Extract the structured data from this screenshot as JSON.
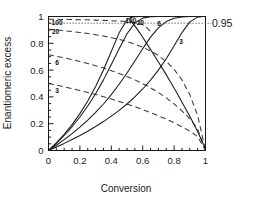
{
  "chart_data": {
    "type": "line",
    "title": "",
    "xlabel": "Conversion",
    "ylabel": "Enantiomeric excess",
    "xlim": [
      0,
      1
    ],
    "ylim": [
      0,
      1
    ],
    "xticks": [
      "0",
      "0.2",
      "0.4",
      "0.6",
      "0.8",
      "1"
    ],
    "xtick_values": [
      0,
      0.2,
      0.4,
      0.6,
      0.8,
      1
    ],
    "yticks": [
      "0",
      "0.2",
      "0.4",
      "0.6",
      "0.8",
      "1"
    ],
    "ytick_values": [
      0,
      0.2,
      0.4,
      0.6,
      0.8,
      1
    ],
    "grid": false,
    "legend": "inline-curve-labels",
    "annotations": [
      {
        "name": "reference-line-label",
        "text": "0.95",
        "value": 0.95,
        "position": "right-outside"
      }
    ],
    "reference_lines": [
      {
        "name": "ee-095-dotted-line",
        "y": 0.95,
        "style": "dotted",
        "label": "0.95"
      }
    ],
    "series": [
      {
        "name": "ee-product-E3",
        "label": "3",
        "style": "dashed",
        "selectivity_E": 3,
        "label_x": 0.055,
        "label_y": 0.445,
        "x": [
          0.0,
          0.05,
          0.1,
          0.15,
          0.2,
          0.25,
          0.3,
          0.35,
          0.4,
          0.45,
          0.5,
          0.55,
          0.6,
          0.65,
          0.7,
          0.75,
          0.8,
          0.85,
          0.9,
          0.95,
          1.0
        ],
        "y": [
          0.5,
          0.488,
          0.475,
          0.462,
          0.448,
          0.433,
          0.418,
          0.401,
          0.384,
          0.366,
          0.347,
          0.327,
          0.306,
          0.283,
          0.259,
          0.234,
          0.207,
          0.177,
          0.145,
          0.104,
          0.0
        ]
      },
      {
        "name": "ee-product-E6",
        "label": "6",
        "style": "dashed",
        "selectivity_E": 6,
        "label_x": 0.055,
        "label_y": 0.655,
        "x": [
          0.0,
          0.05,
          0.1,
          0.15,
          0.2,
          0.25,
          0.3,
          0.35,
          0.4,
          0.45,
          0.5,
          0.55,
          0.6,
          0.65,
          0.7,
          0.75,
          0.8,
          0.85,
          0.9,
          0.95,
          1.0
        ],
        "y": [
          0.714,
          0.703,
          0.691,
          0.678,
          0.664,
          0.649,
          0.633,
          0.615,
          0.596,
          0.575,
          0.552,
          0.527,
          0.499,
          0.468,
          0.433,
          0.393,
          0.348,
          0.296,
          0.238,
          0.16,
          0.0
        ]
      },
      {
        "name": "ee-product-E20",
        "label": "20",
        "style": "dashed",
        "selectivity_E": 20,
        "label_x": 0.045,
        "label_y": 0.885,
        "x": [
          0.0,
          0.05,
          0.1,
          0.15,
          0.2,
          0.25,
          0.3,
          0.35,
          0.4,
          0.45,
          0.5,
          0.55,
          0.6,
          0.65,
          0.7,
          0.75,
          0.8,
          0.85,
          0.9,
          0.95,
          1.0
        ],
        "y": [
          0.905,
          0.9,
          0.894,
          0.888,
          0.881,
          0.873,
          0.864,
          0.854,
          0.842,
          0.829,
          0.813,
          0.794,
          0.771,
          0.743,
          0.708,
          0.664,
          0.606,
          0.527,
          0.416,
          0.262,
          0.0
        ]
      },
      {
        "name": "ee-product-E100",
        "label": "100",
        "style": "dashed",
        "selectivity_E": 100,
        "label_x": 0.055,
        "label_y": 0.955,
        "x": [
          0.0,
          0.05,
          0.1,
          0.15,
          0.2,
          0.25,
          0.3,
          0.35,
          0.4,
          0.45,
          0.48,
          0.5,
          0.52,
          0.55,
          0.58,
          0.6,
          0.62,
          0.65
        ],
        "y": [
          0.98,
          0.979,
          0.978,
          0.977,
          0.976,
          0.975,
          0.973,
          0.971,
          0.969,
          0.966,
          0.964,
          0.962,
          0.959,
          0.954,
          0.946,
          0.938,
          0.925,
          0.888
        ]
      },
      {
        "name": "ee-substrate-E3",
        "label": "3",
        "style": "solid",
        "selectivity_E": 3,
        "label_x": 0.845,
        "label_y": 0.815,
        "x": [
          0.0,
          0.05,
          0.1,
          0.15,
          0.2,
          0.25,
          0.3,
          0.35,
          0.4,
          0.45,
          0.5,
          0.55,
          0.6,
          0.65,
          0.7,
          0.75,
          0.8,
          0.85,
          0.9,
          0.95,
          0.98,
          1.0
        ],
        "y": [
          0.0,
          0.026,
          0.053,
          0.082,
          0.112,
          0.144,
          0.179,
          0.216,
          0.257,
          0.3,
          0.347,
          0.4,
          0.459,
          0.525,
          0.6,
          0.685,
          0.781,
          0.88,
          0.96,
          0.995,
          1.0,
          1.0
        ]
      },
      {
        "name": "ee-substrate-E6",
        "label": "6",
        "style": "solid",
        "selectivity_E": 6,
        "label_x": 0.705,
        "label_y": 0.945,
        "x": [
          0.0,
          0.05,
          0.1,
          0.15,
          0.2,
          0.25,
          0.3,
          0.35,
          0.4,
          0.45,
          0.5,
          0.55,
          0.6,
          0.65,
          0.7,
          0.75,
          0.8,
          0.85,
          0.9,
          1.0
        ],
        "y": [
          0.0,
          0.039,
          0.081,
          0.126,
          0.174,
          0.227,
          0.284,
          0.347,
          0.417,
          0.494,
          0.578,
          0.668,
          0.76,
          0.846,
          0.915,
          0.962,
          0.987,
          0.997,
          1.0,
          1.0
        ]
      },
      {
        "name": "ee-substrate-E20",
        "label": "20",
        "style": "solid",
        "selectivity_E": 20,
        "label_x": 0.585,
        "label_y": 0.955,
        "x": [
          0.0,
          0.05,
          0.1,
          0.15,
          0.2,
          0.25,
          0.3,
          0.35,
          0.4,
          0.45,
          0.5,
          0.55,
          0.6,
          0.65,
          0.7,
          0.8,
          0.9,
          1.0
        ],
        "y": [
          0.0,
          0.053,
          0.112,
          0.177,
          0.25,
          0.332,
          0.424,
          0.527,
          0.641,
          0.76,
          0.871,
          0.951,
          0.988,
          0.998,
          1.0,
          1.0,
          1.0,
          1.0
        ]
      },
      {
        "name": "ee-substrate-E100",
        "label": "100",
        "style": "solid",
        "selectivity_E": 100,
        "label_x": 0.525,
        "label_y": 0.965,
        "x": [
          0.0,
          0.05,
          0.1,
          0.15,
          0.2,
          0.25,
          0.3,
          0.35,
          0.4,
          0.45,
          0.5,
          0.52,
          0.55,
          0.6,
          0.7,
          0.85,
          1.0
        ],
        "y": [
          0.0,
          0.057,
          0.121,
          0.193,
          0.275,
          0.369,
          0.477,
          0.601,
          0.739,
          0.878,
          0.975,
          0.99,
          0.998,
          1.0,
          1.0,
          1.0,
          1.0
        ]
      },
      {
        "name": "ee-descending-solid-E3",
        "label": "",
        "style": "solid",
        "selectivity_E": 3,
        "x": [
          0.52,
          0.55,
          0.58,
          0.6,
          0.63,
          0.66,
          0.7,
          0.74,
          0.78,
          0.82,
          0.86,
          0.9,
          0.94,
          0.97,
          1.0
        ],
        "y": [
          0.975,
          0.93,
          0.88,
          0.845,
          0.79,
          0.735,
          0.66,
          0.585,
          0.505,
          0.425,
          0.34,
          0.255,
          0.165,
          0.09,
          0.01
        ]
      }
    ]
  }
}
